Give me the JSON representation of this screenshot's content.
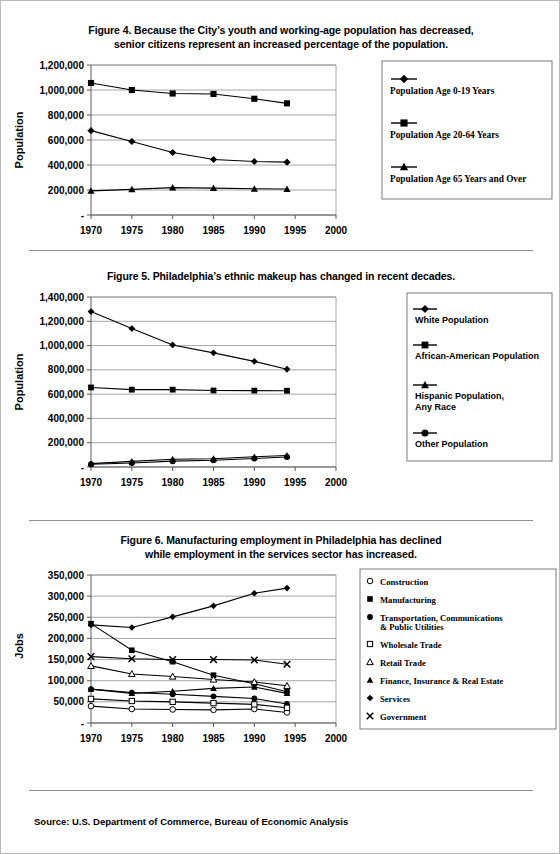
{
  "page": {
    "source_note": "Source: U.S. Department of Commerce, Bureau of Economic Analysis",
    "background": "#ffffff",
    "rule_color": "#8d8d8d"
  },
  "figures": [
    {
      "id": "figure-4",
      "title_line1": "Figure 4. Because the City’s youth and working-age population has decreased,",
      "title_line2": "senior citizens represent an increased percentage of the population.",
      "legend_font": "serif",
      "chart_data": {
        "type": "line",
        "title": "Figure 4. Because the City’s youth and working-age population has decreased, senior citizens represent an increased percentage of the population.",
        "xlabel": "",
        "ylabel": "Population",
        "x": [
          1970,
          1975,
          1980,
          1985,
          1990,
          1994
        ],
        "xlim": [
          1970,
          2000
        ],
        "xticks": [
          1970,
          1975,
          1980,
          1985,
          1990,
          1995,
          2000
        ],
        "xticklabels": [
          "1970",
          "1975",
          "1980",
          "1985",
          "1990",
          "1995",
          "2000"
        ],
        "ylim": [
          0,
          1200000
        ],
        "yticks": [
          0,
          200000,
          400000,
          600000,
          800000,
          1000000,
          1200000
        ],
        "yticklabels": [
          "-",
          "200,000",
          "400,000",
          "600,000",
          "800,000",
          "1,000,000",
          "1,200,000"
        ],
        "grid": true,
        "legend_position": "right",
        "series": [
          {
            "name": "Population Age 0-19 Years",
            "marker": "diamond",
            "values": [
              675000,
              588000,
              500000,
              444000,
              428000,
              423000
            ]
          },
          {
            "name": "Population Age 20-64 Years",
            "marker": "square",
            "values": [
              1056000,
              1000000,
              972000,
              968000,
              930000,
              893000
            ]
          },
          {
            "name": "Population Age 65 Years and Over",
            "marker": "triangle",
            "values": [
              193000,
              205000,
              219000,
              215000,
              210000,
              208000
            ]
          }
        ]
      }
    },
    {
      "id": "figure-5",
      "title_line1": "Figure 5. Philadelphia’s ethnic makeup has changed in recent decades.",
      "title_line2": "",
      "legend_font": "sans",
      "chart_data": {
        "type": "line",
        "title": "Figure 5. Philadelphia’s ethnic makeup has changed in recent decades.",
        "xlabel": "",
        "ylabel": "Population",
        "x": [
          1970,
          1975,
          1980,
          1985,
          1990,
          1994
        ],
        "xlim": [
          1970,
          2000
        ],
        "xticks": [
          1970,
          1975,
          1980,
          1985,
          1990,
          1995,
          2000
        ],
        "xticklabels": [
          "1970",
          "1975",
          "1980",
          "1985",
          "1990",
          "1995",
          "2000"
        ],
        "ylim": [
          0,
          1400000
        ],
        "yticks": [
          0,
          200000,
          400000,
          600000,
          800000,
          1000000,
          1200000,
          1400000
        ],
        "yticklabels": [
          "-",
          "200,000",
          "400,000",
          "600,000",
          "800,000",
          "1,000,000",
          "1,200,000",
          "1,400,000"
        ],
        "grid": true,
        "legend_position": "right",
        "series": [
          {
            "name": "White Population",
            "marker": "diamond",
            "values": [
              1280000,
              1140000,
              1005000,
              940000,
              870000,
              805000
            ]
          },
          {
            "name": "African-American Population",
            "marker": "square",
            "values": [
              655000,
              637000,
              637000,
              630000,
              629000,
              628000
            ]
          },
          {
            "name": "Hispanic Population, Any Race",
            "marker": "triangle",
            "values": [
              28000,
              46000,
              64000,
              68000,
              84000,
              95000
            ]
          },
          {
            "name": "Other Population",
            "marker": "circle",
            "values": [
              23000,
              33000,
              48000,
              55000,
              70000,
              82000
            ]
          }
        ]
      }
    },
    {
      "id": "figure-6",
      "title_line1": "Figure 6. Manufacturing employment in Philadelphia has declined",
      "title_line2": "while employment in the services sector has increased.",
      "legend_font": "serif",
      "chart_data": {
        "type": "line",
        "title": "Figure 6. Manufacturing employment in Philadelphia has declined while employment in the services sector has increased.",
        "xlabel": "",
        "ylabel": "Jobs",
        "x": [
          1970,
          1975,
          1980,
          1985,
          1990,
          1994
        ],
        "xlim": [
          1970,
          2000
        ],
        "xticks": [
          1970,
          1975,
          1980,
          1985,
          1990,
          1995,
          2000
        ],
        "xticklabels": [
          "1970",
          "1975",
          "1980",
          "1985",
          "1990",
          "1995",
          "2000"
        ],
        "ylim": [
          0,
          350000
        ],
        "yticks": [
          0,
          50000,
          100000,
          150000,
          200000,
          250000,
          300000,
          350000
        ],
        "yticklabels": [
          "-",
          "50,000",
          "100,000",
          "150,000",
          "200,000",
          "250,000",
          "300,000",
          "350,000"
        ],
        "grid": true,
        "legend_position": "right",
        "series": [
          {
            "name": "Construction",
            "marker": "circle-open",
            "values": [
              40000,
              33000,
              32000,
              31000,
              33000,
              25000
            ]
          },
          {
            "name": "Manufacturing",
            "marker": "square",
            "values": [
              235000,
              172000,
              145000,
              113000,
              93000,
              74000
            ]
          },
          {
            "name": "Transportation, Communications & Public Utilities",
            "marker": "circle",
            "values": [
              80000,
              72000,
              68000,
              63000,
              58000,
              45000
            ]
          },
          {
            "name": "Wholesale Trade",
            "marker": "square-open",
            "values": [
              57000,
              52000,
              50000,
              47000,
              44000,
              36000
            ]
          },
          {
            "name": "Retail Trade",
            "marker": "triangle-open",
            "values": [
              135000,
              116000,
              110000,
              103000,
              97000,
              88000
            ]
          },
          {
            "name": "Finance, Insurance & Real Estate",
            "marker": "triangle",
            "values": [
              80000,
              70000,
              75000,
              82000,
              85000,
              70000
            ]
          },
          {
            "name": "Services",
            "marker": "diamond",
            "values": [
              232000,
              226000,
              251000,
              277000,
              307000,
              319000
            ]
          },
          {
            "name": "Government",
            "marker": "cross",
            "values": [
              157000,
              152000,
              150000,
              150000,
              149000,
              139000
            ]
          }
        ]
      }
    }
  ]
}
